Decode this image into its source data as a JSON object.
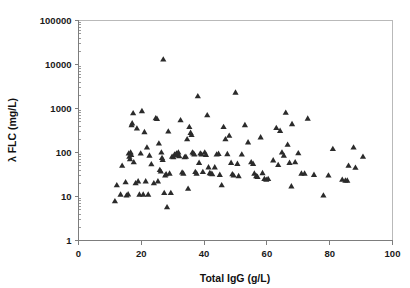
{
  "chart_data": {
    "type": "scatter",
    "title": "",
    "xlabel": "Total IgG (g/L)",
    "ylabel": "λ FLC (mg/L)",
    "xlim": [
      0,
      100
    ],
    "ylim": [
      1,
      100000
    ],
    "yscale": "log",
    "xscale": "linear",
    "grid": false,
    "legend": null,
    "xticks": [
      0,
      20,
      40,
      60,
      80,
      100
    ],
    "xtick_labels": [
      "0",
      "20",
      "40",
      "60",
      "80",
      "100"
    ],
    "yticks": [
      1,
      10,
      100,
      1000,
      10000,
      100000
    ],
    "ytick_labels": [
      "1",
      "10",
      "100",
      "1000",
      "10000",
      "100000"
    ],
    "marker": "triangle",
    "marker_color": "#2b2b2b",
    "series": [
      {
        "name": "patients",
        "points": [
          [
            11.6,
            7.8
          ],
          [
            12.2,
            18.0
          ],
          [
            13.4,
            11.0
          ],
          [
            13.9,
            50.0
          ],
          [
            15.0,
            21.0
          ],
          [
            15.3,
            10.5
          ],
          [
            15.8,
            11.2
          ],
          [
            16.0,
            95.0
          ],
          [
            16.2,
            80.0
          ],
          [
            16.4,
            70.0
          ],
          [
            16.6,
            100.0
          ],
          [
            16.8,
            88.0
          ],
          [
            16.9,
            420.0
          ],
          [
            17.1,
            460.0
          ],
          [
            17.4,
            780.0
          ],
          [
            17.6,
            60.0
          ],
          [
            18.2,
            20.0
          ],
          [
            18.6,
            350.0
          ],
          [
            19.0,
            22.0
          ],
          [
            19.4,
            11.0
          ],
          [
            19.8,
            95.0
          ],
          [
            20.2,
            870.0
          ],
          [
            20.6,
            11.0
          ],
          [
            21.0,
            290.0
          ],
          [
            21.4,
            22.0
          ],
          [
            21.8,
            130.0
          ],
          [
            22.2,
            11.0
          ],
          [
            22.6,
            85.0
          ],
          [
            23.2,
            54.0
          ],
          [
            24.0,
            20.0
          ],
          [
            24.6,
            600.0
          ],
          [
            25.0,
            580.0
          ],
          [
            25.3,
            22.0
          ],
          [
            25.6,
            160.0
          ],
          [
            25.9,
            40.0
          ],
          [
            26.2,
            37.0
          ],
          [
            26.4,
            100.0
          ],
          [
            26.6,
            75.0
          ],
          [
            26.8,
            68.0
          ],
          [
            27.0,
            13000.0
          ],
          [
            27.3,
            12.0
          ],
          [
            27.6,
            30.0
          ],
          [
            27.9,
            32.0
          ],
          [
            28.2,
            5.7
          ],
          [
            28.6,
            300.0
          ],
          [
            29.0,
            33.0
          ],
          [
            29.4,
            12.0
          ],
          [
            29.8,
            80.0
          ],
          [
            30.2,
            78.0
          ],
          [
            30.6,
            90.0
          ],
          [
            30.9,
            86.0
          ],
          [
            31.2,
            95.0
          ],
          [
            31.5,
            88.0
          ],
          [
            31.8,
            100.0
          ],
          [
            32.1,
            82.0
          ],
          [
            32.5,
            540.0
          ],
          [
            33.0,
            35.0
          ],
          [
            33.4,
            33.0
          ],
          [
            33.8,
            78.0
          ],
          [
            34.2,
            80.0
          ],
          [
            34.6,
            200.0
          ],
          [
            34.9,
            15.0
          ],
          [
            35.3,
            380.0
          ],
          [
            35.7,
            280.0
          ],
          [
            36.0,
            250.0
          ],
          [
            36.3,
            100.0
          ],
          [
            36.6,
            95.0
          ],
          [
            36.9,
            90.0
          ],
          [
            37.2,
            36.0
          ],
          [
            37.6,
            33.0
          ],
          [
            38.0,
            1900.0
          ],
          [
            38.4,
            58.0
          ],
          [
            38.8,
            95.0
          ],
          [
            39.2,
            90.0
          ],
          [
            39.6,
            36.0
          ],
          [
            40.2,
            100.0
          ],
          [
            40.6,
            88.0
          ],
          [
            41.0,
            700.0
          ],
          [
            41.4,
            46.0
          ],
          [
            41.8,
            34.0
          ],
          [
            42.2,
            33.0
          ],
          [
            42.6,
            32.0
          ],
          [
            43.4,
            46.0
          ],
          [
            44.0,
            90.0
          ],
          [
            44.6,
            93.0
          ],
          [
            45.0,
            31.0
          ],
          [
            45.6,
            18.0
          ],
          [
            46.2,
            380.0
          ],
          [
            46.8,
            200.0
          ],
          [
            47.4,
            92.0
          ],
          [
            48.0,
            240.0
          ],
          [
            48.6,
            58.0
          ],
          [
            49.0,
            32.0
          ],
          [
            49.4,
            30.0
          ],
          [
            50.0,
            2300.0
          ],
          [
            50.6,
            55.0
          ],
          [
            51.0,
            29.0
          ],
          [
            52.0,
            90.0
          ],
          [
            53.0,
            420.0
          ],
          [
            54.0,
            170.0
          ],
          [
            55.0,
            60.0
          ],
          [
            55.6,
            55.0
          ],
          [
            56.0,
            33.0
          ],
          [
            56.6,
            29.0
          ],
          [
            57.0,
            28.0
          ],
          [
            58.0,
            220.0
          ],
          [
            58.6,
            34.0
          ],
          [
            59.2,
            25.0
          ],
          [
            59.8,
            24.0
          ],
          [
            60.4,
            25.0
          ],
          [
            62.0,
            66.0
          ],
          [
            63.0,
            360.0
          ],
          [
            63.6,
            52.0
          ],
          [
            64.2,
            310.0
          ],
          [
            64.8,
            100.0
          ],
          [
            65.4,
            85.0
          ],
          [
            66.0,
            800.0
          ],
          [
            66.6,
            150.0
          ],
          [
            67.2,
            58.0
          ],
          [
            67.8,
            17.0
          ],
          [
            68.0,
            440.0
          ],
          [
            69.0,
            60.0
          ],
          [
            70.0,
            96.0
          ],
          [
            71.0,
            33.0
          ],
          [
            72.0,
            33.0
          ],
          [
            73.0,
            590.0
          ],
          [
            75.0,
            31.0
          ],
          [
            78.0,
            10.5
          ],
          [
            79.6,
            30.0
          ],
          [
            81.0,
            120.0
          ],
          [
            84.0,
            24.0
          ],
          [
            85.0,
            23.0
          ],
          [
            85.6,
            23.0
          ],
          [
            86.0,
            50.0
          ],
          [
            87.6,
            130.0
          ],
          [
            88.2,
            45.0
          ],
          [
            90.6,
            80.0
          ]
        ]
      }
    ]
  },
  "axes": {
    "y_title": "λ FLC (mg/L)",
    "x_title": "Total IgG (g/L)"
  }
}
